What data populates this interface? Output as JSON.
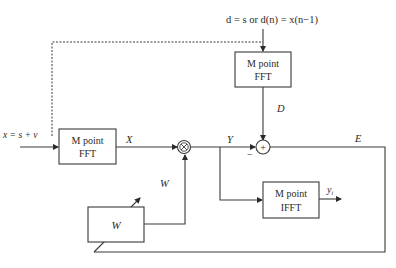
{
  "diagram": {
    "type": "block-diagram",
    "top_input_label": "d = s or d(n) = x(n−1)",
    "input_label": "x = s + v",
    "blocks": {
      "fft_desired": {
        "line1": "M point",
        "line2": "FFT"
      },
      "fft_input": {
        "line1": "M point",
        "line2": "FFT"
      },
      "ifft_output": {
        "line1": "M point",
        "line2": "IFFT"
      },
      "weights": {
        "label": "W"
      }
    },
    "operators": {
      "multiplier": "⊗",
      "adder": "+",
      "adder_minus_sign": "−"
    },
    "signals": {
      "X": "X",
      "Y": "Y",
      "D": "D",
      "E": "E",
      "W": "W",
      "y_out": "y",
      "y_out_subscript": "i"
    },
    "edges": [
      {
        "from": "top_input",
        "to": "fft_desired"
      },
      {
        "from": "input",
        "to": "fft_input"
      },
      {
        "from": "input",
        "to": "fft_desired",
        "style": "dashed"
      },
      {
        "from": "fft_input",
        "to": "multiplier",
        "label": "X"
      },
      {
        "from": "weights",
        "to": "multiplier",
        "label": "W"
      },
      {
        "from": "multiplier",
        "to": "adder",
        "label": "Y",
        "sign": "−"
      },
      {
        "from": "fft_desired",
        "to": "adder",
        "label": "D"
      },
      {
        "from": "multiplier",
        "to": "ifft_output",
        "label": "Y"
      },
      {
        "from": "ifft_output",
        "to": "output",
        "label": "y_i"
      },
      {
        "from": "adder",
        "to": "weights",
        "label": "E",
        "style": "feedback"
      }
    ]
  }
}
